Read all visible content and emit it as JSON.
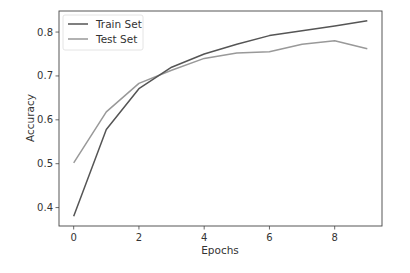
{
  "chart_data": {
    "type": "line",
    "title": "",
    "xlabel": "Epochs",
    "ylabel": "Accuracy",
    "x": [
      0,
      1,
      2,
      3,
      4,
      5,
      6,
      7,
      8,
      9
    ],
    "series": [
      {
        "name": "Train Set",
        "color": "#555555",
        "values": [
          0.38,
          0.578,
          0.671,
          0.72,
          0.75,
          0.772,
          0.792,
          0.803,
          0.814,
          0.826
        ]
      },
      {
        "name": "Test Set",
        "color": "#999999",
        "values": [
          0.502,
          0.618,
          0.683,
          0.713,
          0.74,
          0.752,
          0.755,
          0.772,
          0.78,
          0.762
        ]
      }
    ],
    "xticks": [
      0,
      2,
      4,
      6,
      8
    ],
    "yticks": [
      0.4,
      0.5,
      0.6,
      0.7,
      0.8
    ],
    "xtick_labels": [
      "0",
      "2",
      "4",
      "6",
      "8"
    ],
    "ytick_labels": [
      "0.4",
      "0.5",
      "0.6",
      "0.7",
      "0.8"
    ],
    "xlim": [
      -0.45,
      9.45
    ],
    "ylim": [
      0.358,
      0.848
    ],
    "grid": false,
    "legend_position": "upper left"
  }
}
